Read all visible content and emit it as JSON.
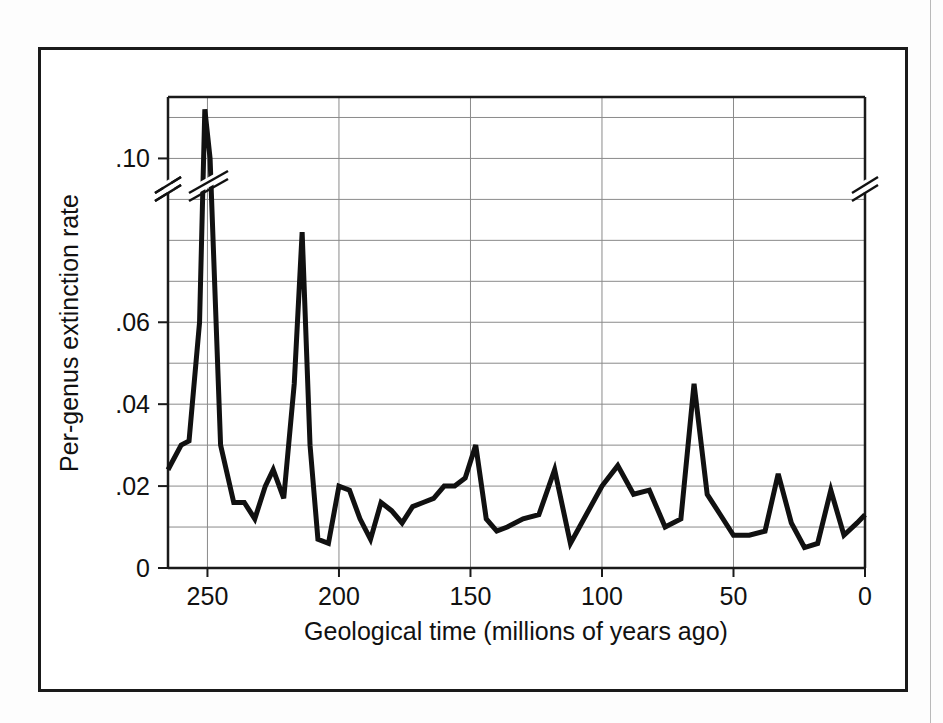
{
  "figure": {
    "kind": "line-chart",
    "background": "#ffffff",
    "frame_color": "#1a1a1a"
  },
  "chart_data": {
    "type": "line",
    "title": "",
    "subtitle": "",
    "xlabel": "Geological time (millions of years ago)",
    "ylabel": "Per-genus extinction rate",
    "xlim": [
      265,
      0
    ],
    "ylim": [
      0,
      0.115
    ],
    "x_reversed": true,
    "grid": true,
    "legend": null,
    "legend_position": "none",
    "line_color": "#111111",
    "grid_color": "#8a8a8a",
    "axis_break": {
      "present": true,
      "axis": "y",
      "value_approx": 0.088,
      "note": "slanted double-slash break drawn on the left spine, on the right spine, and across the rising Permian line"
    },
    "x_ticks": [
      250,
      200,
      150,
      100,
      50,
      0
    ],
    "x_tick_labels": [
      "250",
      "200",
      "150",
      "100",
      "50",
      "0"
    ],
    "y_ticks": [
      0,
      0.02,
      0.04,
      0.06,
      0.1
    ],
    "y_tick_labels": [
      "0",
      ".02",
      ".04",
      ".06",
      ".10"
    ],
    "y_minor_gridlines": [
      0.01,
      0.03,
      0.05,
      0.07,
      0.08,
      0.09,
      0.11
    ],
    "series": [
      {
        "name": "Per-genus extinction rate",
        "x": [
          265,
          260,
          257,
          253,
          251,
          249,
          245,
          240,
          236,
          232,
          228,
          225,
          221,
          217,
          214,
          211,
          208,
          204,
          200,
          196,
          192,
          188,
          184,
          180,
          176,
          172,
          168,
          164,
          160,
          156,
          152,
          148,
          144,
          140,
          136,
          130,
          124,
          118,
          112,
          106,
          100,
          94,
          88,
          82,
          76,
          70,
          65,
          60,
          55,
          50,
          44,
          38,
          33,
          28,
          23,
          18,
          13,
          8,
          3,
          0
        ],
        "y": [
          0.024,
          0.03,
          0.031,
          0.06,
          0.112,
          0.1,
          0.03,
          0.016,
          0.016,
          0.012,
          0.02,
          0.024,
          0.017,
          0.045,
          0.082,
          0.03,
          0.007,
          0.006,
          0.02,
          0.019,
          0.012,
          0.007,
          0.016,
          0.014,
          0.011,
          0.015,
          0.016,
          0.017,
          0.02,
          0.02,
          0.022,
          0.03,
          0.012,
          0.009,
          0.01,
          0.012,
          0.013,
          0.024,
          0.006,
          0.013,
          0.02,
          0.025,
          0.018,
          0.019,
          0.01,
          0.012,
          0.045,
          0.018,
          0.013,
          0.008,
          0.008,
          0.009,
          0.023,
          0.011,
          0.005,
          0.006,
          0.019,
          0.008,
          0.011,
          0.013
        ]
      }
    ]
  }
}
